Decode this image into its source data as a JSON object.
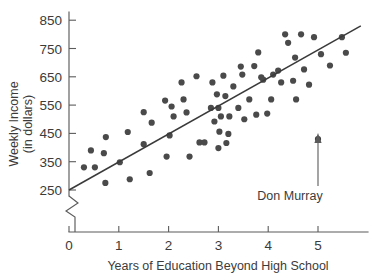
{
  "chart_data": {
    "type": "scatter",
    "title": "",
    "xlabel": "Years of Education Beyond High School",
    "ylabel": "Weekly Income (in dollars)",
    "ylabel_line1": "Weekly Income",
    "ylabel_line2": "(in dollars)",
    "xlim": [
      0,
      5.9
    ],
    "ylim": [
      250,
      880
    ],
    "xticks": [
      "0",
      "1",
      "2",
      "3",
      "4",
      "5"
    ],
    "xtick_values": [
      0,
      1,
      2,
      3,
      4,
      5
    ],
    "yticks": [
      "250",
      "350",
      "450",
      "550",
      "650",
      "750",
      "850"
    ],
    "ytick_values": [
      250,
      350,
      450,
      550,
      650,
      750,
      850
    ],
    "y_axis_break": true,
    "grid": false,
    "legend": null,
    "marker_color": "#4a4a4a",
    "line_color": "#3a3a3a",
    "trendline": {
      "label": "regression line",
      "x_start": 0,
      "y_start": 250,
      "x_end": 5.86,
      "y_end": 830
    },
    "annotations": [
      {
        "name": "don-murray",
        "text": "Don Murray",
        "point_x": 5.0,
        "point_y": 430,
        "label_x": 4.78,
        "label_y": 268,
        "arrow": "up"
      }
    ],
    "points": [
      {
        "x": 0.3,
        "y": 330
      },
      {
        "x": 0.44,
        "y": 390
      },
      {
        "x": 0.52,
        "y": 330
      },
      {
        "x": 0.7,
        "y": 380
      },
      {
        "x": 0.74,
        "y": 437
      },
      {
        "x": 0.73,
        "y": 275
      },
      {
        "x": 1.02,
        "y": 348
      },
      {
        "x": 1.18,
        "y": 455
      },
      {
        "x": 1.22,
        "y": 288
      },
      {
        "x": 1.5,
        "y": 525
      },
      {
        "x": 1.5,
        "y": 412
      },
      {
        "x": 1.62,
        "y": 310
      },
      {
        "x": 1.66,
        "y": 488
      },
      {
        "x": 1.93,
        "y": 566
      },
      {
        "x": 1.96,
        "y": 368
      },
      {
        "x": 2.02,
        "y": 443
      },
      {
        "x": 2.06,
        "y": 545
      },
      {
        "x": 2.1,
        "y": 510
      },
      {
        "x": 2.26,
        "y": 630
      },
      {
        "x": 2.3,
        "y": 570
      },
      {
        "x": 2.36,
        "y": 524
      },
      {
        "x": 2.42,
        "y": 368
      },
      {
        "x": 2.56,
        "y": 652
      },
      {
        "x": 2.62,
        "y": 418
      },
      {
        "x": 2.72,
        "y": 418
      },
      {
        "x": 2.85,
        "y": 540
      },
      {
        "x": 2.88,
        "y": 630
      },
      {
        "x": 2.92,
        "y": 492
      },
      {
        "x": 2.97,
        "y": 588
      },
      {
        "x": 3.0,
        "y": 540
      },
      {
        "x": 3.0,
        "y": 398
      },
      {
        "x": 3.02,
        "y": 456
      },
      {
        "x": 3.05,
        "y": 510
      },
      {
        "x": 3.1,
        "y": 654
      },
      {
        "x": 3.14,
        "y": 582
      },
      {
        "x": 3.16,
        "y": 416
      },
      {
        "x": 3.2,
        "y": 448
      },
      {
        "x": 3.22,
        "y": 510
      },
      {
        "x": 3.3,
        "y": 616
      },
      {
        "x": 3.4,
        "y": 540
      },
      {
        "x": 3.45,
        "y": 686
      },
      {
        "x": 3.48,
        "y": 658
      },
      {
        "x": 3.52,
        "y": 500
      },
      {
        "x": 3.62,
        "y": 570
      },
      {
        "x": 3.72,
        "y": 688
      },
      {
        "x": 3.76,
        "y": 516
      },
      {
        "x": 3.8,
        "y": 736
      },
      {
        "x": 3.86,
        "y": 648
      },
      {
        "x": 3.9,
        "y": 640
      },
      {
        "x": 3.98,
        "y": 520
      },
      {
        "x": 4.06,
        "y": 570
      },
      {
        "x": 4.1,
        "y": 658
      },
      {
        "x": 4.2,
        "y": 672
      },
      {
        "x": 4.26,
        "y": 630
      },
      {
        "x": 4.34,
        "y": 800
      },
      {
        "x": 4.4,
        "y": 770
      },
      {
        "x": 4.5,
        "y": 636
      },
      {
        "x": 4.54,
        "y": 718
      },
      {
        "x": 4.56,
        "y": 570
      },
      {
        "x": 4.66,
        "y": 800
      },
      {
        "x": 4.72,
        "y": 676
      },
      {
        "x": 4.82,
        "y": 622
      },
      {
        "x": 4.92,
        "y": 790
      },
      {
        "x": 5.0,
        "y": 430
      },
      {
        "x": 5.06,
        "y": 730
      },
      {
        "x": 5.24,
        "y": 690
      },
      {
        "x": 5.48,
        "y": 790
      },
      {
        "x": 5.56,
        "y": 735
      }
    ]
  }
}
